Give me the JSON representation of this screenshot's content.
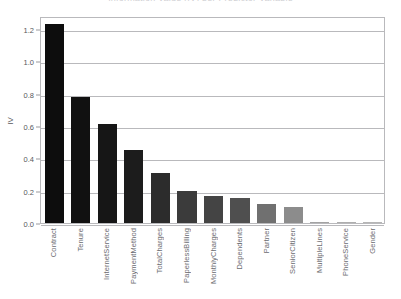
{
  "chart_data": {
    "type": "bar",
    "title": "Information Value (IV) per Predictor Variable",
    "xlabel": "",
    "ylabel": "IV",
    "ylim": [
      0.0,
      1.28
    ],
    "yticks": [
      "0.0",
      "0.2",
      "0.4",
      "0.6",
      "0.8",
      "1.0",
      "1.2"
    ],
    "ytick_values": [
      0.0,
      0.2,
      0.4,
      0.6,
      0.8,
      1.0,
      1.2
    ],
    "grid": true,
    "legend": "none",
    "categories": [
      "Contract",
      "Tenure",
      "InternetService",
      "PaymentMethod",
      "TotalCharges",
      "PaperlessBilling",
      "MonthlyCharges",
      "Dependents",
      "Partner",
      "SeniorCitizen",
      "MultipleLines",
      "PhoneService",
      "Gender"
    ],
    "values": [
      1.23,
      0.78,
      0.61,
      0.45,
      0.31,
      0.195,
      0.165,
      0.155,
      0.115,
      0.1,
      0.005,
      0.002,
      0.001
    ],
    "bar_colors": [
      "#0d0d0d",
      "#111111",
      "#161616",
      "#1c1c1c",
      "#2c2c2c",
      "#3b3b3b",
      "#444444",
      "#4f4f4f",
      "#707070",
      "#8c8c8c",
      "#a3a3a3",
      "#aeaeae",
      "#b5b5b5"
    ]
  }
}
